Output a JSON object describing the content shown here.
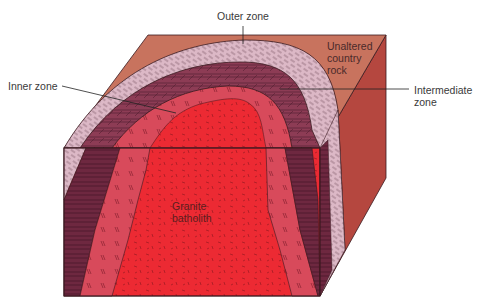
{
  "figure": {
    "type": "block diagram"
  },
  "labels": {
    "outer_zone": "Outer zone",
    "inner_zone": "Inner zone",
    "unaltered_country_rock": [
      "Unaltered",
      "country",
      "rock"
    ],
    "intermediate_zone": [
      "Intermediate",
      "zone"
    ],
    "granite_batholith": [
      "Granite",
      "batholith"
    ]
  },
  "colors": {
    "background": "#ffffff",
    "country_rock_top": "#c8735e",
    "country_rock_side": "#b5473f",
    "outer_zone": "#d9b3c2",
    "intermediate_zone": "#8a3a52",
    "inner_zone": "#d94a5a",
    "granite": "#ea2b34",
    "line": "#3a1a20"
  }
}
